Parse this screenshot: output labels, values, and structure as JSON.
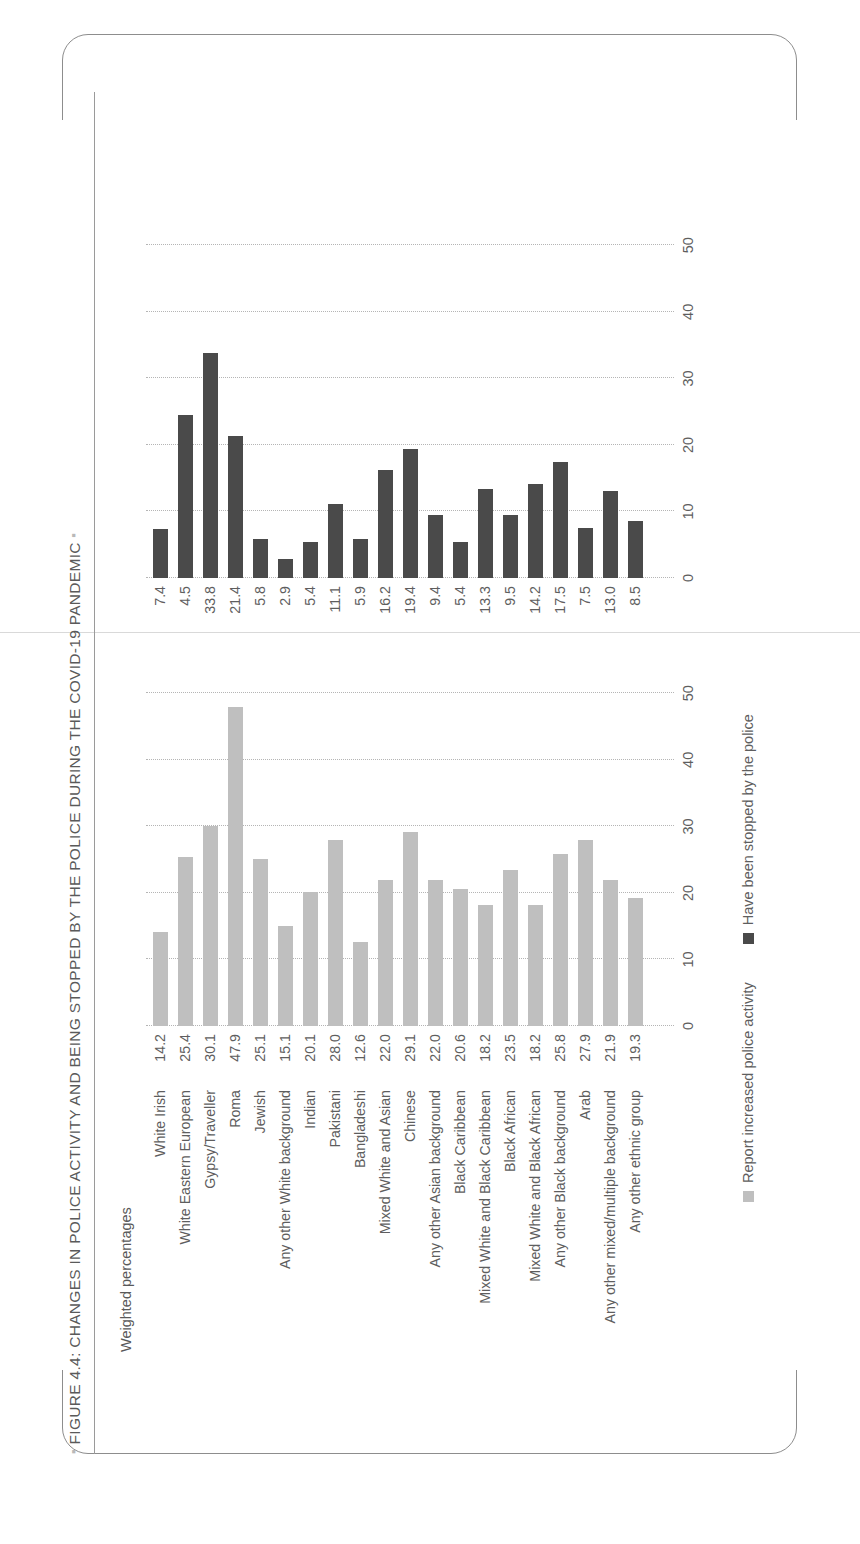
{
  "figure": {
    "title": "FIGURE 4.4: CHANGES IN POLICE ACTIVITY AND BEING STOPPED BY THE POLICE DURING THE COVID-19 PANDEMIC",
    "bullet": "▪"
  },
  "chart_data": {
    "type": "bar",
    "title": "FIGURE 4.4: CHANGES IN POLICE ACTIVITY AND BEING STOPPED BY THE POLICE DURING THE COVID-19 PANDEMIC",
    "xlabel": "",
    "ylabel": "Weighted percentages",
    "orientation": "horizontal",
    "grid": "dotted vertical gridlines at each tick",
    "legend_position": "bottom",
    "xlim": [
      0,
      55
    ],
    "ticks": [
      0,
      10,
      20,
      30,
      40,
      50
    ],
    "tick_labels": [
      "0",
      "10",
      "20",
      "30",
      "40",
      "50"
    ],
    "categories": [
      "White Irish",
      "White Eastern European",
      "Gypsy/Traveller",
      "Roma",
      "Jewish",
      "Any other White background",
      "Indian",
      "Pakistani",
      "Bangladeshi",
      "Mixed White and Asian",
      "Chinese",
      "Any other Asian background",
      "Black Caribbean",
      "Mixed White and Black Caribbean",
      "Black African",
      "Mixed White and Black African",
      "Any other Black background",
      "Arab",
      "Any other mixed/multiple background",
      "Any other ethnic group"
    ],
    "series": [
      {
        "name": "Report increased police activity",
        "color": "#bfbfbf",
        "values": [
          14.2,
          25.4,
          30.1,
          47.9,
          25.1,
          15.1,
          20.1,
          28.0,
          12.6,
          22.0,
          29.1,
          22.0,
          20.6,
          18.2,
          23.5,
          18.2,
          25.8,
          27.9,
          21.9,
          19.3
        ],
        "labels": [
          "14.2",
          "25.4",
          "30.1",
          "47.9",
          "25.1",
          "15.1",
          "20.1",
          "28.0",
          "12.6",
          "22.0",
          "29.1",
          "22.0",
          "20.6",
          "18.2",
          "23.5",
          "18.2",
          "25.8",
          "27.9",
          "21.9",
          "19.3"
        ]
      },
      {
        "name": "Have been stopped by the police",
        "color": "#4a4a4a",
        "values": [
          7.4,
          24.5,
          33.8,
          21.4,
          5.8,
          2.9,
          5.4,
          11.1,
          5.9,
          16.2,
          19.4,
          9.4,
          5.4,
          13.3,
          9.5,
          14.2,
          17.5,
          7.5,
          13.0,
          8.5
        ],
        "labels": [
          "7.4",
          "4.5",
          "33.8",
          "21.4",
          "5.8",
          "2.9",
          "5.4",
          "11.1",
          "5.9",
          "16.2",
          "19.4",
          "9.4",
          "5.4",
          "13.3",
          "9.5",
          "14.2",
          "17.5",
          "7.5",
          "13.0",
          "8.5"
        ]
      }
    ]
  },
  "legend": {
    "items": [
      {
        "label": "Report increased police activity",
        "color": "#bfbfbf"
      },
      {
        "label": "Have been stopped by the police",
        "color": "#4a4a4a"
      }
    ]
  }
}
